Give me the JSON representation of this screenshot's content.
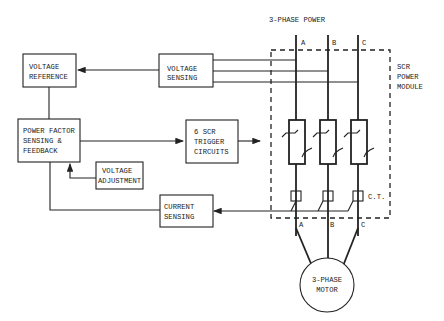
{
  "diagram": {
    "title": "3-PHASE POWER",
    "blocks": {
      "voltage_reference": [
        "VOLTAGE",
        "REFERENCE"
      ],
      "voltage_sensing": [
        "VOLTAGE",
        "SENSING"
      ],
      "power_factor": [
        "POWER FACTOR",
        "SENSING &",
        "FEEDBACK"
      ],
      "scr_trigger": [
        "6 SCR",
        "TRIGGER",
        "CIRCUITS"
      ],
      "voltage_adjustment": [
        "VOLTAGE",
        "ADJUSTMENT"
      ],
      "current_sensing": [
        "CURRENT",
        "SENSING"
      ],
      "motor": [
        "3-PHASE",
        "MOTOR"
      ]
    },
    "module_label": [
      "SCR",
      "POWER",
      "MODULE"
    ],
    "ct_label": "C.T.",
    "phases_top": [
      "A",
      "B",
      "C"
    ],
    "phases_bottom": [
      "A",
      "B",
      "C"
    ]
  }
}
